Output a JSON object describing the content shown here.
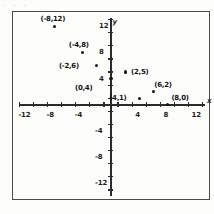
{
  "scan_fragment": ". . .",
  "chart_data": {
    "type": "scatter",
    "title": "",
    "subtitle": "",
    "xlabel": "x",
    "ylabel": "y",
    "xlim": [
      -14,
      14
    ],
    "ylim": [
      -14,
      14
    ],
    "grid": false,
    "legend": null,
    "x_ticks": [
      -12,
      -8,
      -4,
      4,
      8,
      12
    ],
    "y_ticks": [
      12,
      8,
      4,
      -4,
      -8,
      -12
    ],
    "x_tick_labels": [
      "-12",
      "-8",
      "-4",
      "4",
      "8",
      "12"
    ],
    "y_tick_labels": [
      "12",
      "8",
      "4",
      "-4",
      "-8",
      "-12"
    ],
    "minor_tick_step": 2,
    "points": [
      {
        "label": "(-8,12)",
        "x": -8,
        "y": 12
      },
      {
        "label": "(-4,8)",
        "x": -4,
        "y": 8
      },
      {
        "label": "(-2,6)",
        "x": -2,
        "y": 6
      },
      {
        "label": "(0,4)",
        "x": 0,
        "y": 4
      },
      {
        "label": "(2,5)",
        "x": 2,
        "y": 5
      },
      {
        "label": "(4,1)",
        "x": 4,
        "y": 1
      },
      {
        "label": "(6,2)",
        "x": 6,
        "y": 2
      },
      {
        "label": "(8,0)",
        "x": 8,
        "y": 0
      }
    ]
  },
  "axes": {
    "x_name": "x",
    "y_name": "y"
  }
}
